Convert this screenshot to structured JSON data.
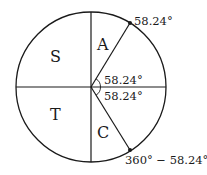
{
  "diagram": {
    "type": "unit-circle-quadrants",
    "quadrant_labels": {
      "first": "A",
      "second": "S",
      "third": "T",
      "fourth": "C"
    },
    "angles": {
      "upper_angle": "58.24°",
      "lower_angle": "58.24°",
      "point_upper_label": "58.24°",
      "point_lower_label": "360° − 58.24°"
    },
    "colors": {
      "stroke": "#1a1a1a",
      "background": "#ffffff"
    }
  }
}
